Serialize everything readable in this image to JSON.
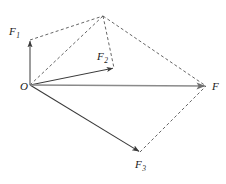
{
  "figure": {
    "type": "vector-force-diagram",
    "background_color": "#ffffff",
    "width": 226,
    "height": 184
  },
  "points": {
    "origin": {
      "label": "O",
      "subscript": "",
      "x": 30,
      "y": 85,
      "label_x": 20,
      "label_y": 90
    },
    "f1": {
      "label": "F",
      "subscript": "1",
      "x": 30,
      "y": 40,
      "label_x": 9,
      "label_y": 35
    },
    "f2": {
      "label": "F",
      "subscript": "2",
      "x": 114,
      "y": 68,
      "label_x": 97,
      "label_y": 60
    },
    "f3": {
      "label": "F",
      "subscript": "3",
      "x": 140,
      "y": 152,
      "label_x": 135,
      "label_y": 168
    },
    "resultant": {
      "label": "F",
      "subscript": "",
      "x": 206,
      "y": 86,
      "label_x": 212,
      "label_y": 90
    },
    "apex": {
      "label": "",
      "subscript": "",
      "x": 103,
      "y": 16,
      "label_x": 0,
      "label_y": 0
    }
  },
  "solid_vectors": [
    {
      "name": "vector-f1",
      "from": "origin",
      "to": "f1",
      "color": "#3a3a3a",
      "width": 1.0,
      "arrow": true
    },
    {
      "name": "vector-f2",
      "from": "origin",
      "to": "f2",
      "color": "#3a3a3a",
      "width": 1.0,
      "arrow": true
    },
    {
      "name": "vector-f3",
      "from": "origin",
      "to": "f3",
      "color": "#3a3a3a",
      "width": 1.1,
      "arrow": true
    },
    {
      "name": "vector-resultant",
      "from": "origin",
      "to": "resultant",
      "color": "#8a8a8a",
      "width": 1.6,
      "arrow": true
    }
  ],
  "dashed_lines": [
    {
      "name": "construction-f1-apex",
      "from": "f1",
      "to": "apex",
      "color": "#555555"
    },
    {
      "name": "construction-origin-apex",
      "from": "origin",
      "to": "apex",
      "color": "#555555"
    },
    {
      "name": "construction-apex-f2",
      "from": "apex",
      "to": "f2",
      "color": "#555555"
    },
    {
      "name": "construction-apex-resultant",
      "from": "apex",
      "to": "resultant",
      "color": "#555555"
    },
    {
      "name": "construction-f3-resultant",
      "from": "f3",
      "to": "resultant",
      "color": "#555555"
    }
  ],
  "style": {
    "dash_pattern": "3,2.4",
    "dash_width": 0.9,
    "label_color": "#1a1a1a",
    "accent_gray": "#8a8a8a",
    "stroke_dark": "#3a3a3a"
  },
  "caption": ""
}
